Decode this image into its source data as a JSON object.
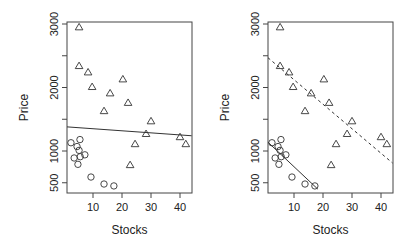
{
  "chart_data": [
    {
      "type": "scatter",
      "panel": "left",
      "title": "",
      "xlabel": "Stocks",
      "ylabel": "Price",
      "xlim": [
        1,
        44
      ],
      "ylim": [
        400,
        3000
      ],
      "xticks": [
        10,
        20,
        30,
        40
      ],
      "yticks": [
        500,
        1000,
        1500,
        2000,
        2500,
        3000
      ],
      "ytick_labels": [
        "500",
        "1000",
        "",
        "2000",
        "",
        "3000"
      ],
      "grid": false,
      "series": [
        {
          "name": "triangles",
          "marker": "triangle",
          "x": [
            5.2,
            5.2,
            8.3,
            9.7,
            15.9,
            20.3,
            22.1,
            13.8,
            30,
            28.3,
            24.5,
            40,
            42,
            22.8
          ],
          "y": [
            2950,
            2340,
            2240,
            2010,
            1910,
            2130,
            1760,
            1630,
            1470,
            1270,
            1110,
            1220,
            1110,
            780
          ]
        },
        {
          "name": "circles",
          "marker": "circle",
          "x": [
            2.4,
            5.5,
            4.5,
            5.2,
            3.5,
            5.6,
            7.2,
            4.8,
            9.3,
            13.8,
            17.2
          ],
          "y": [
            1130,
            1180,
            1070,
            1010,
            890,
            910,
            940,
            790,
            590,
            480,
            450
          ]
        }
      ],
      "lines": [
        {
          "name": "pooled-fit",
          "style": "solid",
          "x": [
            1,
            44
          ],
          "y": [
            1380,
            1240
          ]
        }
      ]
    },
    {
      "type": "scatter",
      "panel": "right",
      "title": "",
      "xlabel": "Stocks",
      "ylabel": "Price",
      "xlim": [
        1,
        44
      ],
      "ylim": [
        400,
        3000
      ],
      "xticks": [
        10,
        20,
        30,
        40
      ],
      "yticks": [
        500,
        1000,
        1500,
        2000,
        2500,
        3000
      ],
      "ytick_labels": [
        "500",
        "1000",
        "",
        "2000",
        "",
        "3000"
      ],
      "grid": false,
      "series": [
        {
          "name": "triangles",
          "marker": "triangle",
          "x": [
            5.2,
            5.2,
            8.3,
            9.7,
            15.9,
            20.3,
            22.1,
            13.8,
            30,
            28.3,
            24.5,
            40,
            42,
            22.8
          ],
          "y": [
            2950,
            2340,
            2240,
            2010,
            1910,
            2130,
            1760,
            1630,
            1470,
            1270,
            1110,
            1220,
            1110,
            780
          ]
        },
        {
          "name": "circles",
          "marker": "circle",
          "x": [
            2.4,
            5.5,
            4.5,
            5.2,
            3.5,
            5.6,
            7.2,
            4.8,
            9.3,
            13.8,
            17.2
          ],
          "y": [
            1130,
            1180,
            1070,
            1010,
            890,
            910,
            940,
            790,
            590,
            480,
            450
          ]
        }
      ],
      "lines": [
        {
          "name": "circle-group-fit",
          "style": "solid",
          "x": [
            1,
            18.2
          ],
          "y": [
            1140,
            400
          ]
        },
        {
          "name": "triangle-group-fit",
          "style": "dashed",
          "x": [
            1,
            44
          ],
          "y": [
            2470,
            810
          ]
        }
      ]
    }
  ]
}
